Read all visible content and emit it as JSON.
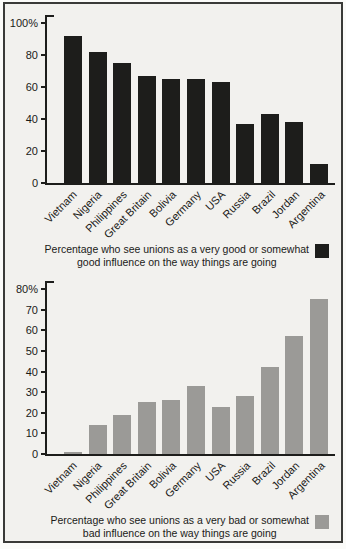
{
  "page": {
    "background_color": "#f2f1ee",
    "border_color": "#3a3a38"
  },
  "chart_data": [
    {
      "type": "bar",
      "categories": [
        "Vietnam",
        "Nigeria",
        "Philippines",
        "Great Britain",
        "Bolivia",
        "Germany",
        "USA",
        "Russia",
        "Brazil",
        "Jordan",
        "Argentina"
      ],
      "values": [
        92,
        82,
        75,
        67,
        65,
        65,
        63,
        37,
        43,
        38,
        12
      ],
      "ylim": [
        0,
        100
      ],
      "ytick_step": 20,
      "ytick_labels": [
        "100%",
        "80",
        "60",
        "40",
        "20",
        "0"
      ],
      "grid": false,
      "bar_color": "#1d1d1b",
      "legend": {
        "position": "below-right",
        "swatch_color": "#1d1d1b",
        "line1": "Percentage who see unions as a very good or somewhat",
        "line2": "good influence on the way things are going"
      }
    },
    {
      "type": "bar",
      "categories": [
        "Vietnam",
        "Nigeria",
        "Philippines",
        "Great Britain",
        "Bolivia",
        "Germany",
        "USA",
        "Russia",
        "Brazil",
        "Jordan",
        "Argentina"
      ],
      "values": [
        1,
        14,
        19,
        25,
        26,
        33,
        23,
        28,
        42,
        57,
        75
      ],
      "ylim": [
        0,
        80
      ],
      "ytick_step": 10,
      "ytick_labels": [
        "80%",
        "70",
        "60",
        "50",
        "40",
        "30",
        "20",
        "10",
        "0"
      ],
      "grid": false,
      "bar_color": "#9b9a97",
      "legend": {
        "position": "below-right",
        "swatch_color": "#9b9a97",
        "line1": "Percentage who see unions as a very bad or somewhat",
        "line2": "bad influence on the way things are going"
      }
    }
  ]
}
